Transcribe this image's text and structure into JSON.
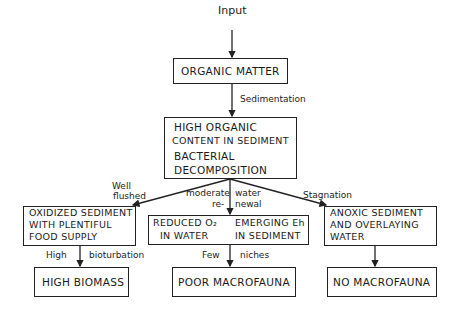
{
  "labels": {
    "input": "Input",
    "sedimentation": "Sedimentation",
    "well": "Well",
    "flushed": "flushed",
    "moderate": "moderate",
    "re": "re-",
    "water": "water",
    "newal": "newal",
    "stagnation": "Stagnation",
    "high": "High",
    "bioturbation": "bioturbation",
    "few": "Few",
    "niches": "niches"
  },
  "boxes": {
    "organic_matter": "ORGANIC MATTER",
    "high_organic_line1": "HIGH ORGANIC",
    "high_organic_line2": "CONTENT IN SEDIMENT",
    "bacterial_line1": "BACTERIAL",
    "bacterial_line2": "DECOMPOSITION",
    "oxidized_line1": "OXIDIZED SEDIMENT",
    "oxidized_line2": "WITH PLENTIFUL",
    "oxidized_line3": "FOOD SUPPLY",
    "reduced_line1": "REDUCED O₂",
    "reduced_line2": "IN WATER",
    "emerging_line1": "EMERGING Eh",
    "emerging_line2": "IN SEDIMENT",
    "anoxic_line1": "ANOXIC SEDIMENT",
    "anoxic_line2": "AND OVERLAYING",
    "anoxic_line3": "WATER",
    "high_biomass": "HIGH BIOMASS",
    "poor_macrofauna": "POOR MACROFAUNA",
    "no_macrofauna": "NO MACROFAUNA"
  }
}
